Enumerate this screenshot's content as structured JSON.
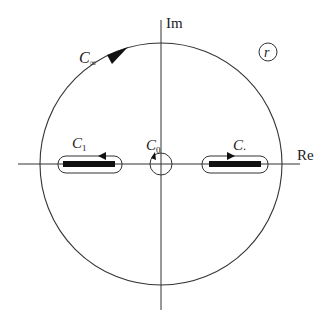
{
  "diagram": {
    "type": "complex-plane contour diagram",
    "axes": {
      "real_label": "Re",
      "imag_label": "Im"
    },
    "contours": {
      "big_circle": {
        "label_main": "C",
        "label_sub": "∞",
        "direction": "counterclockwise"
      },
      "small_circle": {
        "label_main": "C",
        "label_sub": "0",
        "direction": "clockwise"
      },
      "left_slot": {
        "label_main": "C",
        "label_sub": "1",
        "direction": "leftward on top"
      },
      "right_slot": {
        "label_main": "C",
        "label_sub": ".",
        "direction": "rightward on top"
      }
    },
    "region_label": "r",
    "colors": {
      "line": "#333333",
      "cut": "#111111",
      "background": "#ffffff"
    }
  }
}
